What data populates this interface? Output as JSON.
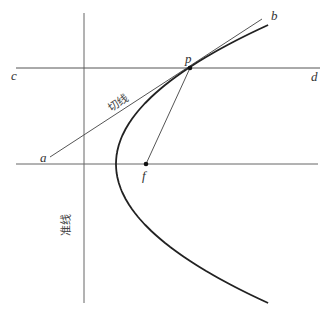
{
  "diagram": {
    "title": "",
    "type": "parabola-tangent-construction",
    "colors": {
      "line": "#555555",
      "curve": "#222222",
      "text": "#333333",
      "background": "#ffffff"
    },
    "points": {
      "a": {
        "label": "a",
        "x": 48,
        "y": 158
      },
      "b": {
        "label": "b",
        "x": 265,
        "y": 17
      },
      "c": {
        "label": "c",
        "x": 16,
        "y": 68
      },
      "d": {
        "label": "d",
        "x": 320,
        "y": 68
      },
      "p": {
        "label": "p",
        "x": 190,
        "y": 68
      },
      "f": {
        "label": "f",
        "x": 146,
        "y": 164
      }
    },
    "lines": {
      "tangent_label": "切线",
      "directrix_label": "准线"
    },
    "parabola": {
      "vertex": [
        116,
        164
      ],
      "focus": [
        146,
        164
      ],
      "directrix_x": 84,
      "opens": "right",
      "y_range": [
        25,
        303
      ]
    }
  }
}
